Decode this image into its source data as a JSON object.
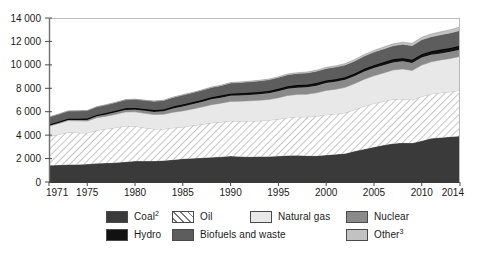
{
  "chart_data": {
    "type": "area",
    "title": "",
    "subtitle": "",
    "xlabel": "",
    "ylabel": "",
    "stacked": true,
    "grid": false,
    "legend_position": "bottom",
    "xlim": [
      1971,
      2014
    ],
    "ylim": [
      0,
      14000
    ],
    "ytick_step": 2000,
    "ytick_labels": [
      "0",
      "2 000",
      "4 000",
      "6 000",
      "8 000",
      "10 000",
      "12 000",
      "14 000"
    ],
    "ytick_values": [
      0,
      2000,
      4000,
      6000,
      8000,
      10000,
      12000,
      14000
    ],
    "xtick_labels": [
      "1971",
      "1975",
      "1980",
      "1985",
      "1990",
      "1995",
      "2000",
      "2005",
      "2010",
      "2014"
    ],
    "xtick_values": [
      1971,
      1975,
      1980,
      1985,
      1990,
      1995,
      2000,
      2005,
      2010,
      2014
    ],
    "x": [
      1971,
      1972,
      1973,
      1974,
      1975,
      1976,
      1977,
      1978,
      1979,
      1980,
      1981,
      1982,
      1983,
      1984,
      1985,
      1986,
      1987,
      1988,
      1989,
      1990,
      1991,
      1992,
      1993,
      1994,
      1995,
      1996,
      1997,
      1998,
      1999,
      2000,
      2001,
      2002,
      2003,
      2004,
      2005,
      2006,
      2007,
      2008,
      2009,
      2010,
      2011,
      2012,
      2013,
      2014
    ],
    "series": [
      {
        "name": "Coal",
        "legend_label": "Coal",
        "legend_sup": "2",
        "color": "#3a3a3a",
        "pattern": "solid",
        "values": [
          1440,
          1460,
          1490,
          1500,
          1530,
          1590,
          1630,
          1660,
          1720,
          1790,
          1790,
          1800,
          1840,
          1910,
          1990,
          2020,
          2070,
          2120,
          2150,
          2220,
          2180,
          2160,
          2170,
          2180,
          2220,
          2270,
          2280,
          2250,
          2240,
          2310,
          2370,
          2440,
          2640,
          2810,
          2990,
          3150,
          3290,
          3350,
          3330,
          3520,
          3730,
          3800,
          3870,
          3930
        ]
      },
      {
        "name": "Oil",
        "legend_label": "Oil",
        "legend_sup": "",
        "color": "#ffffff",
        "pattern": "diagonal-hatch",
        "values": [
          2440,
          2590,
          2760,
          2710,
          2660,
          2830,
          2900,
          2990,
          3060,
          2970,
          2840,
          2730,
          2690,
          2720,
          2700,
          2800,
          2850,
          2930,
          2970,
          3000,
          3010,
          3050,
          3050,
          3100,
          3150,
          3220,
          3290,
          3310,
          3380,
          3430,
          3440,
          3470,
          3540,
          3670,
          3720,
          3740,
          3770,
          3740,
          3690,
          3780,
          3790,
          3820,
          3840,
          3900
        ]
      },
      {
        "name": "Natural gas",
        "legend_label": "Natural gas",
        "legend_sup": "",
        "color": "#e8e8e8",
        "pattern": "solid",
        "values": [
          890,
          940,
          990,
          1010,
          1010,
          1070,
          1090,
          1130,
          1200,
          1230,
          1230,
          1230,
          1250,
          1330,
          1380,
          1410,
          1480,
          1550,
          1610,
          1660,
          1700,
          1720,
          1750,
          1760,
          1820,
          1900,
          1910,
          1940,
          1990,
          2080,
          2110,
          2170,
          2230,
          2300,
          2360,
          2420,
          2500,
          2560,
          2500,
          2680,
          2740,
          2800,
          2840,
          2890
        ]
      },
      {
        "name": "Nuclear",
        "legend_label": "Nuclear",
        "legend_sup": "",
        "color": "#8a8a8a",
        "pattern": "solid",
        "values": [
          29,
          38,
          51,
          70,
          98,
          116,
          143,
          172,
          176,
          186,
          218,
          221,
          251,
          314,
          380,
          399,
          427,
          457,
          464,
          476,
          497,
          505,
          520,
          535,
          558,
          576,
          575,
          589,
          612,
          625,
          631,
          640,
          635,
          646,
          659,
          660,
          650,
          650,
          638,
          640,
          595,
          560,
          563,
          570
        ]
      },
      {
        "name": "Hydro",
        "legend_label": "Hydro",
        "legend_sup": "",
        "color": "#111111",
        "pattern": "solid",
        "values": [
          104,
          109,
          111,
          119,
          122,
          122,
          128,
          136,
          142,
          148,
          151,
          156,
          164,
          170,
          174,
          179,
          181,
          185,
          185,
          186,
          191,
          192,
          199,
          200,
          210,
          218,
          217,
          222,
          225,
          226,
          225,
          224,
          224,
          235,
          245,
          255,
          260,
          270,
          280,
          296,
          310,
          322,
          330,
          340
        ]
      },
      {
        "name": "Biofuels and waste",
        "legend_label": "Biofuels and waste",
        "legend_sup": "",
        "color": "#5d5d5d",
        "pattern": "solid",
        "values": [
          642,
          650,
          657,
          665,
          676,
          686,
          695,
          707,
          718,
          730,
          742,
          755,
          767,
          780,
          793,
          806,
          818,
          830,
          843,
          905,
          915,
          925,
          936,
          948,
          960,
          975,
          985,
          995,
          1010,
          1025,
          1035,
          1050,
          1070,
          1090,
          1115,
          1135,
          1155,
          1180,
          1200,
          1225,
          1245,
          1265,
          1285,
          1305
        ]
      },
      {
        "name": "Other",
        "legend_label": "Other",
        "legend_sup": "3",
        "color": "#c2c2c2",
        "pattern": "solid",
        "values": [
          4,
          5,
          6,
          7,
          8,
          9,
          11,
          12,
          14,
          16,
          18,
          20,
          23,
          26,
          29,
          32,
          35,
          38,
          41,
          45,
          48,
          52,
          56,
          60,
          65,
          70,
          76,
          82,
          89,
          96,
          104,
          112,
          121,
          131,
          142,
          154,
          167,
          181,
          196,
          212,
          230,
          249,
          270,
          292
        ]
      }
    ],
    "totals": {
      "1971": 5549,
      "1980": 7069,
      "1990": 8492,
      "2000": 9791,
      "2010": 12351,
      "2014": 13227
    }
  },
  "legend": {
    "row_0": [
      {
        "label": "Coal",
        "sup": "2",
        "swatch": "coal-swatch"
      },
      {
        "label": "Oil",
        "sup": "",
        "swatch": "oil-swatch"
      },
      {
        "label": "Natural gas",
        "sup": "",
        "swatch": "natural-gas-swatch"
      },
      {
        "label": "Nuclear",
        "sup": "",
        "swatch": "nuclear-swatch"
      }
    ],
    "row_1": [
      {
        "label": "Hydro",
        "sup": "",
        "swatch": "hydro-swatch"
      },
      {
        "label": "Biofuels and waste",
        "sup": "",
        "swatch": "biofuels-swatch"
      },
      {
        "label": "Other",
        "sup": "3",
        "swatch": "other-swatch"
      }
    ]
  }
}
